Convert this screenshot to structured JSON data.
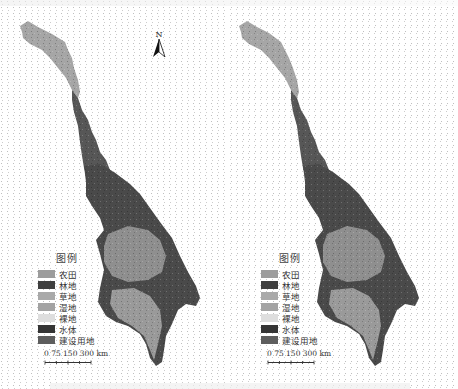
{
  "figure": {
    "panels": [
      {
        "id": "left",
        "legend": {
          "title": "图例",
          "items": [
            {
              "label": "农田",
              "color": "#9c9c9c"
            },
            {
              "label": "林地",
              "color": "#3f3f3f"
            },
            {
              "label": "草地",
              "color": "#a9a9a9"
            },
            {
              "label": "湿地",
              "color": "#a3a3a3"
            },
            {
              "label": "裸地",
              "color": "#dedede"
            },
            {
              "label": "水体",
              "color": "#353535"
            },
            {
              "label": "建设用地",
              "color": "#5e5e5e"
            }
          ]
        },
        "scale_bar": {
          "ticks": "0 75 150   300 km"
        }
      },
      {
        "id": "right",
        "legend": {
          "title": "图例",
          "items": [
            {
              "label": "农田",
              "color": "#9c9c9c"
            },
            {
              "label": "林地",
              "color": "#3f3f3f"
            },
            {
              "label": "草地",
              "color": "#a9a9a9"
            },
            {
              "label": "湿地",
              "color": "#a3a3a3"
            },
            {
              "label": "裸地",
              "color": "#dedede"
            },
            {
              "label": "水体",
              "color": "#353535"
            },
            {
              "label": "建设用地",
              "color": "#5e5e5e"
            }
          ]
        },
        "scale_bar": {
          "ticks": "0 75 150   300 km"
        }
      }
    ],
    "north_arrow": {
      "label": "N"
    }
  },
  "colors": {
    "upper_region": "#a6a6a6",
    "mid_region": "#5a5a5a",
    "dark_region": "#474747",
    "lower_region": "#8e8e8e",
    "delta_region": "#9a9a9a"
  }
}
